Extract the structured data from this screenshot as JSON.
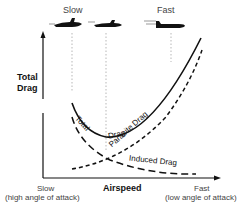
{
  "diagram": {
    "speed_labels": {
      "slow": "Slow",
      "fast": "Fast"
    },
    "y_axis_label_line1": "Total",
    "y_axis_label_line2": "Drag",
    "x_axis_label": "Airspeed",
    "x_min_label_line1": "Slow",
    "x_min_label_line2": "(high angle of attack)",
    "x_max_label_line1": "Fast",
    "x_max_label_line2": "(low angle of attack)",
    "curves": {
      "total": "Total",
      "total2": "Drag",
      "parasite": "Parasite Drag",
      "induced": "Induced Drag"
    }
  }
}
